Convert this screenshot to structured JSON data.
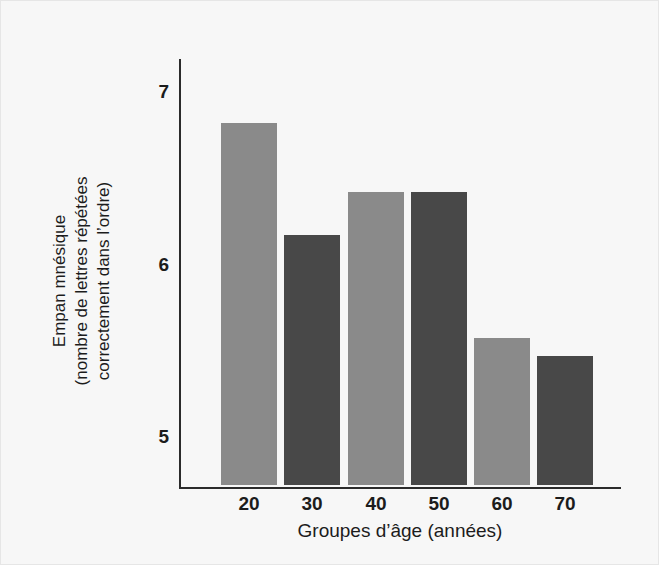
{
  "chart_data": {
    "type": "bar",
    "title": "",
    "xlabel": "Groupes d’âge (années)",
    "ylabel_lines": [
      "Empan mnésique",
      "(nombre de lettres répétées",
      "correctement dans l’ordre)"
    ],
    "ylabel": "Empan mnésique (nombre de lettres répétées correctement dans l’ordre)",
    "categories": [
      "20",
      "30",
      "40",
      "50",
      "60",
      "70"
    ],
    "values": [
      6.8,
      6.15,
      6.4,
      6.4,
      5.55,
      5.45
    ],
    "ylim": [
      4.7,
      7.2
    ],
    "yticks": [
      "7",
      "6",
      "5"
    ],
    "ytick_values": [
      7,
      6,
      5
    ],
    "grid": false,
    "legend": "none",
    "bar_colors": [
      "#8a8a8a",
      "#484848",
      "#8a8a8a",
      "#484848",
      "#8a8a8a",
      "#484848"
    ],
    "colors": {
      "background": "#f7f7f7",
      "frame_border": "#e6e6e6",
      "axis": "#2b2b2b",
      "bar_light": "#8a8a8a",
      "bar_dark": "#484848",
      "text": "#1c1c1c"
    }
  }
}
